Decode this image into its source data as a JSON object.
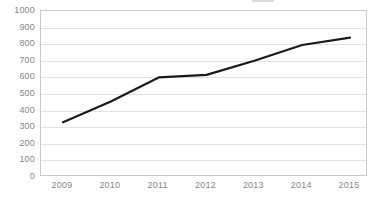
{
  "chart_data": {
    "type": "line",
    "title": "",
    "xlabel": "",
    "ylabel": "",
    "categories": [
      "2009",
      "2010",
      "2011",
      "2012",
      "2013",
      "2014",
      "2015"
    ],
    "x": [
      2009,
      2010,
      2011,
      2012,
      2013,
      2014,
      2015
    ],
    "values": [
      330,
      455,
      600,
      615,
      700,
      795,
      840
    ],
    "series": [
      {
        "name": "",
        "values": [
          330,
          455,
          600,
          615,
          700,
          795,
          840
        ],
        "color": "#1a1a1a",
        "line_width": 2.2,
        "markers": false
      }
    ],
    "ylim": [
      0,
      1000
    ],
    "ytick_step": 100,
    "yticks": [
      0,
      100,
      200,
      300,
      400,
      500,
      600,
      700,
      800,
      900,
      1000
    ],
    "ytick_labels": [
      "0",
      "100",
      "200",
      "300",
      "400",
      "500",
      "600",
      "700",
      "800",
      "900",
      "1000"
    ],
    "xtick_labels": [
      "2009",
      "2010",
      "2011",
      "2012",
      "2013",
      "2014",
      "2015"
    ],
    "grid": {
      "horizontal": true,
      "vertical": false,
      "color": "#e2e2e2"
    },
    "plot_border_color": "#c9c9c9",
    "background_color": "#ffffff",
    "tick_label_color": "#878787",
    "legend": {
      "position": "top-right",
      "visible": true,
      "clipped": true,
      "label": "",
      "swatch_color": "#8d8d8d"
    }
  }
}
